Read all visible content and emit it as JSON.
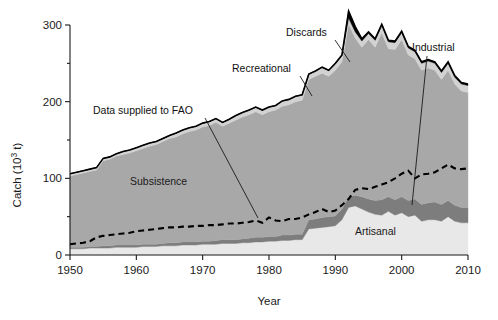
{
  "axes": {
    "ylabel": "Catch (10",
    "ylabel_sup": "3",
    "ylabel_tail": " t)",
    "ylabel_full": "Catch (10^3 t)",
    "xlabel": "Year",
    "yticks": [
      "0",
      "100",
      "200",
      "300"
    ],
    "xticks": [
      "1950",
      "1960",
      "1970",
      "1980",
      "1990",
      "2000",
      "2010"
    ]
  },
  "annotations": {
    "fao": "Data supplied to FAO",
    "recreational": "Recreational",
    "discards": "Discards",
    "industrial": "Industrial"
  },
  "inline_labels": {
    "subsistence": "Subsistence",
    "artisanal": "Artisanal"
  },
  "colors": {
    "artisanal": "#e8e8e8",
    "industrial": "#7d7d7d",
    "subsistence": "#a8a8a8",
    "recreational": "#d2d2d2",
    "discards": "#000000",
    "fao_line": "#000000",
    "axis": "#1a1a1a",
    "background": "#ffffff"
  },
  "chart_data": {
    "type": "area",
    "stacked": true,
    "title": "",
    "xlabel": "Year",
    "ylabel": "Catch (10^3 t)",
    "xlim": [
      1950,
      2010
    ],
    "ylim": [
      0,
      300
    ],
    "grid": false,
    "legend": "inline-annotations",
    "x": [
      1950,
      1951,
      1952,
      1953,
      1954,
      1955,
      1956,
      1957,
      1958,
      1959,
      1960,
      1961,
      1962,
      1963,
      1964,
      1965,
      1966,
      1967,
      1968,
      1969,
      1970,
      1971,
      1972,
      1973,
      1974,
      1975,
      1976,
      1977,
      1978,
      1979,
      1980,
      1981,
      1982,
      1983,
      1984,
      1985,
      1986,
      1987,
      1988,
      1989,
      1990,
      1991,
      1992,
      1993,
      1994,
      1995,
      1996,
      1997,
      1998,
      1999,
      2000,
      2001,
      2002,
      2003,
      2004,
      2005,
      2006,
      2007,
      2008,
      2009,
      2010
    ],
    "series": [
      {
        "name": "Artisanal",
        "color": "#e8e8e8",
        "values": [
          8,
          8,
          8,
          9,
          9,
          9,
          9,
          10,
          10,
          10,
          10,
          11,
          11,
          11,
          12,
          12,
          12,
          13,
          13,
          13,
          14,
          14,
          14,
          15,
          15,
          15,
          16,
          16,
          17,
          17,
          18,
          18,
          19,
          19,
          20,
          20,
          34,
          35,
          36,
          37,
          38,
          46,
          62,
          64,
          60,
          56,
          53,
          52,
          57,
          52,
          55,
          50,
          52,
          44,
          46,
          46,
          44,
          50,
          44,
          42,
          42
        ]
      },
      {
        "name": "Industrial",
        "color": "#7d7d7d",
        "values": [
          2,
          2,
          2,
          2,
          2,
          3,
          3,
          3,
          3,
          3,
          3,
          3,
          3,
          3,
          3,
          4,
          4,
          4,
          4,
          4,
          4,
          4,
          5,
          5,
          5,
          5,
          5,
          6,
          6,
          6,
          6,
          6,
          7,
          7,
          7,
          7,
          12,
          12,
          13,
          13,
          13,
          14,
          14,
          14,
          16,
          17,
          18,
          20,
          19,
          20,
          21,
          21,
          21,
          22,
          22,
          23,
          22,
          21,
          21,
          20,
          20
        ]
      },
      {
        "name": "Subsistence",
        "color": "#a8a8a8",
        "values": [
          93,
          95,
          97,
          98,
          100,
          111,
          113,
          116,
          118,
          120,
          123,
          125,
          128,
          130,
          133,
          136,
          138,
          141,
          144,
          146,
          149,
          151,
          154,
          148,
          152,
          156,
          159,
          161,
          164,
          160,
          163,
          165,
          168,
          170,
          173,
          175,
          183,
          186,
          188,
          183,
          190,
          192,
          225,
          205,
          195,
          208,
          200,
          218,
          193,
          196,
          205,
          190,
          183,
          175,
          176,
          172,
          163,
          170,
          158,
          152,
          150
        ]
      },
      {
        "name": "Recreational",
        "color": "#d2d2d2",
        "values": [
          3,
          3,
          3,
          3,
          3,
          3,
          3,
          3,
          4,
          4,
          4,
          4,
          4,
          4,
          4,
          4,
          5,
          5,
          5,
          5,
          5,
          5,
          5,
          5,
          5,
          6,
          6,
          6,
          6,
          6,
          6,
          6,
          7,
          7,
          7,
          7,
          7,
          7,
          8,
          8,
          8,
          8,
          8,
          8,
          8,
          8,
          9,
          9,
          9,
          9,
          9,
          9,
          9,
          9,
          9,
          9,
          9,
          9,
          9,
          9,
          9
        ]
      },
      {
        "name": "Discards",
        "color": "#000000",
        "values": [
          0,
          0,
          0,
          0,
          0,
          0,
          0,
          0,
          0,
          0,
          0,
          0,
          0,
          0,
          0,
          0,
          0,
          0,
          0,
          0,
          0,
          0,
          0,
          0,
          0,
          0,
          0,
          0,
          0,
          0,
          0,
          0,
          0,
          0,
          0,
          0,
          0,
          0,
          0,
          0,
          1,
          1,
          9,
          7,
          3,
          2,
          2,
          2,
          2,
          2,
          2,
          2,
          2,
          2,
          2,
          2,
          2,
          2,
          2,
          2,
          2
        ]
      }
    ],
    "reference_line": {
      "name": "Data supplied to FAO",
      "style": "dashed",
      "color": "#000000",
      "values": [
        14,
        15,
        16,
        18,
        23,
        25,
        26,
        27,
        28,
        29,
        31,
        32,
        33,
        34,
        35,
        36,
        36,
        37,
        37,
        38,
        38,
        39,
        39,
        40,
        41,
        41,
        42,
        43,
        45,
        42,
        49,
        45,
        44,
        47,
        47,
        49,
        53,
        56,
        60,
        56,
        58,
        65,
        73,
        85,
        87,
        86,
        89,
        92,
        95,
        100,
        106,
        110,
        100,
        105,
        106,
        108,
        113,
        118,
        113,
        112,
        113
      ]
    }
  }
}
